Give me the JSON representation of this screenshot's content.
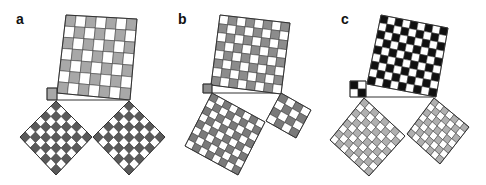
{
  "figure": {
    "width": 486,
    "height": 185,
    "stroke_color": "#333333",
    "panels": [
      {
        "label": "a",
        "label_pos": [
          16,
          12
        ],
        "squares": [
          {
            "name": "hypotenuse-square",
            "corners": [
              [
                66,
                15
              ],
              [
                137,
                19
              ],
              [
                130,
                100
              ],
              [
                57,
                93
              ]
            ],
            "n": 7,
            "dark": "#a8a8a8",
            "light": "#ffffff",
            "start_dark": true
          },
          {
            "name": "unit-square",
            "corners": [
              [
                47,
                88
              ],
              [
                57,
                88
              ],
              [
                57,
                100
              ],
              [
                47,
                100
              ]
            ],
            "n": 1,
            "dark": "#a8a8a8",
            "light": "#ffffff",
            "start_dark": true
          },
          {
            "name": "left-leg-square",
            "corners": [
              [
                56,
                101
              ],
              [
                92,
                137
              ],
              [
                56,
                175
              ],
              [
                20,
                137
              ]
            ],
            "n": 7,
            "dark": "#5a5a5a",
            "light": "#ffffff",
            "start_dark": true
          },
          {
            "name": "right-leg-square",
            "corners": [
              [
                129,
                101
              ],
              [
                165,
                137
              ],
              [
                129,
                175
              ],
              [
                93,
                137
              ]
            ],
            "n": 7,
            "dark": "#5a5a5a",
            "light": "#ffffff",
            "start_dark": true
          }
        ],
        "lines": [
          [
            [
              56,
              100
            ],
            [
              129,
              100
            ]
          ]
        ]
      },
      {
        "label": "b",
        "label_pos": [
          178,
          12
        ],
        "squares": [
          {
            "name": "hypotenuse-square",
            "corners": [
              [
                220,
                15
              ],
              [
                290,
                23
              ],
              [
                281,
                94
              ],
              [
                211,
                85
              ]
            ],
            "n": 8,
            "dark": "#8c8c8c",
            "light": "#ffffff",
            "start_dark": false
          },
          {
            "name": "unit-square",
            "corners": [
              [
                203,
                84
              ],
              [
                212,
                84
              ],
              [
                212,
                93
              ],
              [
                203,
                93
              ]
            ],
            "n": 1,
            "dark": "#8c8c8c",
            "light": "#ffffff",
            "start_dark": true
          },
          {
            "name": "left-leg-square",
            "corners": [
              [
                212,
                93
              ],
              [
                265,
                122
              ],
              [
                238,
                175
              ],
              [
                185,
                146
              ]
            ],
            "n": 8,
            "dark": "#7a7a7a",
            "light": "#ffffff",
            "start_dark": true
          },
          {
            "name": "right-leg-square",
            "corners": [
              [
                281,
                93
              ],
              [
                311,
                110
              ],
              [
                296,
                138
              ],
              [
                266,
                121
              ]
            ],
            "n": 4,
            "dark": "#7a7a7a",
            "light": "#ffffff",
            "start_dark": true
          }
        ],
        "lines": [
          [
            [
              212,
              93
            ],
            [
              280,
              93
            ]
          ]
        ]
      },
      {
        "label": "c",
        "label_pos": [
          341,
          12
        ],
        "squares": [
          {
            "name": "hypotenuse-square",
            "corners": [
              [
                381,
                15
              ],
              [
                448,
                28
              ],
              [
                436,
                97
              ],
              [
                367,
                84
              ]
            ],
            "n": 9,
            "dark": "#111111",
            "light": "#ffffff",
            "start_dark": true
          },
          {
            "name": "small-square",
            "corners": [
              [
                350,
                81
              ],
              [
                366,
                81
              ],
              [
                366,
                97
              ],
              [
                350,
                97
              ]
            ],
            "n": 2,
            "dark": "#111111",
            "light": "#ffffff",
            "start_dark": true
          },
          {
            "name": "left-leg-square",
            "corners": [
              [
                364,
                98
              ],
              [
                405,
                136
              ],
              [
                369,
                176
              ],
              [
                330,
                140
              ]
            ],
            "n": 8,
            "dark": "#b0b0b0",
            "light": "#ffffff",
            "start_dark": true
          },
          {
            "name": "right-leg-square",
            "corners": [
              [
                434,
                98
              ],
              [
                469,
                127
              ],
              [
                440,
                164
              ],
              [
                407,
                134
              ]
            ],
            "n": 7,
            "dark": "#b0b0b0",
            "light": "#ffffff",
            "start_dark": true
          }
        ],
        "lines": [
          [
            [
              366,
              97
            ],
            [
              434,
              97
            ]
          ]
        ]
      }
    ]
  }
}
